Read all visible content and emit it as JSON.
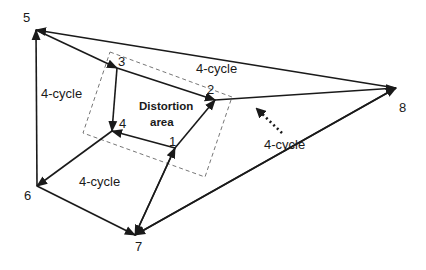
{
  "diagram": {
    "type": "directed-graph",
    "nodes": [
      {
        "id": "5",
        "label": "5",
        "x": 36,
        "y": 30,
        "lx": 23,
        "ly": 22
      },
      {
        "id": "3",
        "label": "3",
        "x": 117,
        "y": 68,
        "lx": 118,
        "ly": 66
      },
      {
        "id": "2",
        "label": "2",
        "x": 215,
        "y": 100,
        "lx": 207,
        "ly": 94
      },
      {
        "id": "8",
        "label": "8",
        "x": 396,
        "y": 88,
        "lx": 399,
        "ly": 112
      },
      {
        "id": "4",
        "label": "4",
        "x": 112,
        "y": 131,
        "lx": 119,
        "ly": 128
      },
      {
        "id": "1",
        "label": "1",
        "x": 175,
        "y": 148,
        "lx": 169,
        "ly": 146
      },
      {
        "id": "6",
        "label": "6",
        "x": 37,
        "y": 186,
        "lx": 24,
        "ly": 200
      },
      {
        "id": "7",
        "label": "7",
        "x": 135,
        "y": 235,
        "lx": 135,
        "ly": 251
      }
    ],
    "edges": [
      {
        "from": "5",
        "to": "3"
      },
      {
        "from": "8",
        "to": "5"
      },
      {
        "from": "3",
        "to": "2"
      },
      {
        "from": "3",
        "to": "4"
      },
      {
        "from": "1",
        "to": "4"
      },
      {
        "from": "1",
        "to": "2"
      },
      {
        "from": "2",
        "to": "8"
      },
      {
        "from": "7",
        "to": "8"
      },
      {
        "from": "8",
        "to": "7"
      },
      {
        "from": "7",
        "to": "1"
      },
      {
        "from": "1",
        "to": "7"
      },
      {
        "from": "6",
        "to": "5"
      },
      {
        "from": "4",
        "to": "6"
      },
      {
        "from": "6",
        "to": "7"
      }
    ],
    "distortion_region": {
      "points": "110,52 232,97 205,177 83,133",
      "label_line1": "Distortion",
      "label_line2": "area"
    },
    "cycle_labels": [
      {
        "text": "4-cycle",
        "x": 41,
        "y": 98
      },
      {
        "text": "4-cycle",
        "x": 196,
        "y": 73
      },
      {
        "text": "4-cycle",
        "x": 79,
        "y": 186
      },
      {
        "text": "4-cycle",
        "x": 264,
        "y": 149
      }
    ],
    "pointer_arrow": {
      "x1": 282,
      "y1": 133,
      "x2": 257,
      "y2": 109
    }
  }
}
